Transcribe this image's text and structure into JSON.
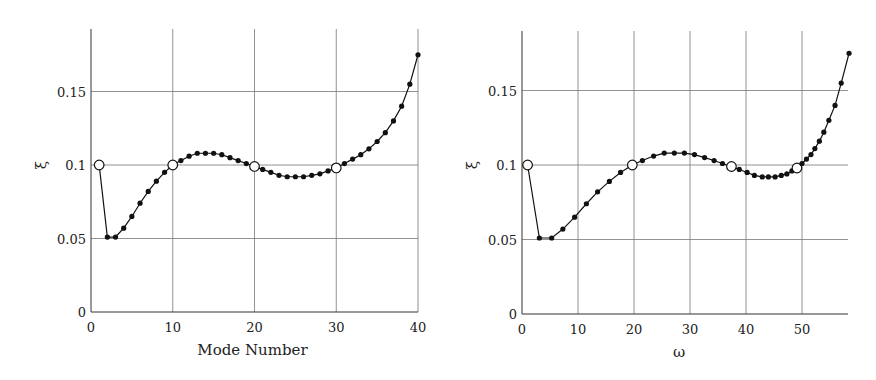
{
  "chart_data": [
    {
      "type": "line",
      "title": "",
      "xlabel": "Mode Number",
      "ylabel": "ξ",
      "xlim": [
        0,
        40
      ],
      "ylim": [
        0,
        0.19
      ],
      "xticks": [
        0,
        10,
        20,
        30,
        40
      ],
      "yticks": [
        0,
        0.05,
        0.1,
        0.15
      ],
      "xtick_labels": [
        "0",
        "10",
        "20",
        "30",
        "40"
      ],
      "ytick_labels": [
        "0",
        "0.05",
        "0.1",
        "0.15"
      ],
      "grid": true,
      "legend": null,
      "series": [
        {
          "name": "damping ratio",
          "x": [
            1,
            2,
            3,
            4,
            5,
            6,
            7,
            8,
            9,
            10,
            11,
            12,
            13,
            14,
            15,
            16,
            17,
            18,
            19,
            20,
            21,
            22,
            23,
            24,
            25,
            26,
            27,
            28,
            29,
            30,
            31,
            32,
            33,
            34,
            35,
            36,
            37,
            38,
            39,
            40
          ],
          "values": [
            0.1,
            0.051,
            0.051,
            0.057,
            0.065,
            0.074,
            0.082,
            0.089,
            0.095,
            0.1,
            0.103,
            0.106,
            0.108,
            0.108,
            0.108,
            0.107,
            0.105,
            0.103,
            0.101,
            0.099,
            0.097,
            0.095,
            0.093,
            0.092,
            0.092,
            0.092,
            0.093,
            0.094,
            0.096,
            0.098,
            0.101,
            0.104,
            0.107,
            0.111,
            0.116,
            0.122,
            0.13,
            0.14,
            0.155,
            0.175
          ],
          "open_markers_at_x": [
            1,
            10,
            20,
            30
          ]
        }
      ]
    },
    {
      "type": "line",
      "title": "",
      "xlabel": "ω",
      "ylabel": "ξ",
      "xlim": [
        0,
        58.5
      ],
      "ylim": [
        0,
        0.19
      ],
      "xticks": [
        0,
        10,
        20,
        30,
        40,
        50
      ],
      "yticks": [
        0,
        0.05,
        0.1,
        0.15
      ],
      "xtick_labels": [
        "0",
        "10",
        "20",
        "30",
        "40",
        "50"
      ],
      "ytick_labels": [
        "0",
        "0.05",
        "0.1",
        "0.15"
      ],
      "grid": true,
      "legend": null,
      "series": [
        {
          "name": "damping ratio",
          "x": [
            1.0,
            3.1,
            5.3,
            7.3,
            9.4,
            11.5,
            13.5,
            15.6,
            17.6,
            19.7,
            21.5,
            23.5,
            25.4,
            27.2,
            29.0,
            30.8,
            32.6,
            34.3,
            35.8,
            37.4,
            38.8,
            40.2,
            41.5,
            42.9,
            44.0,
            45.2,
            46.3,
            47.3,
            48.2,
            49.1,
            50.0,
            50.8,
            51.6,
            52.3,
            53.1,
            53.9,
            54.8,
            55.9,
            57.0,
            58.4
          ],
          "values": [
            0.1,
            0.051,
            0.051,
            0.057,
            0.065,
            0.074,
            0.082,
            0.089,
            0.095,
            0.1,
            0.103,
            0.106,
            0.108,
            0.108,
            0.108,
            0.107,
            0.105,
            0.103,
            0.101,
            0.099,
            0.097,
            0.095,
            0.093,
            0.092,
            0.092,
            0.092,
            0.093,
            0.094,
            0.096,
            0.098,
            0.101,
            0.104,
            0.107,
            0.111,
            0.116,
            0.122,
            0.13,
            0.14,
            0.155,
            0.175
          ],
          "open_markers_at_index": [
            0,
            9,
            19,
            29
          ]
        }
      ]
    }
  ],
  "charts": {
    "left": {
      "xlabel": "Mode Number",
      "ylabel": "ξ",
      "xtick_labels": [
        "0",
        "10",
        "20",
        "30",
        "40"
      ],
      "ytick_labels": [
        "0",
        "0.05",
        "0.1",
        "0.15"
      ]
    },
    "right": {
      "xlabel": "ω",
      "ylabel": "ξ",
      "xtick_labels": [
        "0",
        "10",
        "20",
        "30",
        "40",
        "50"
      ],
      "ytick_labels": [
        "0",
        "0.05",
        "0.1",
        "0.15"
      ]
    }
  }
}
